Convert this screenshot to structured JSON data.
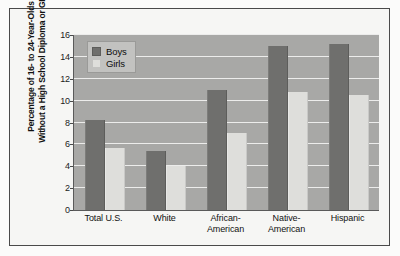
{
  "chart_data": {
    "type": "bar",
    "title": "",
    "xlabel": "",
    "ylabel": "Percentage of 16- to 24-Year-Olds Without a High School Diploma or GED",
    "ylabel_line1": "Percentage of 16- to 24-Year-Olds",
    "ylabel_line2": "Without a High School Diploma or GED",
    "categories": [
      "Total U.S.",
      "White",
      "African-American",
      "Native-American",
      "Hispanic"
    ],
    "category_lines": [
      [
        "Total U.S."
      ],
      [
        "White"
      ],
      [
        "African-",
        "American"
      ],
      [
        "Native-",
        "American"
      ],
      [
        "Hispanic"
      ]
    ],
    "series": [
      {
        "name": "Boys",
        "color": "#6f6f6d",
        "values": [
          8.2,
          5.4,
          11.0,
          15.0,
          15.2
        ]
      },
      {
        "name": "Girls",
        "color": "#dededb",
        "values": [
          5.7,
          4.0,
          7.0,
          10.8,
          10.5
        ]
      }
    ],
    "ylim": [
      0,
      16
    ],
    "ytick_values": [
      0,
      2,
      4,
      6,
      8,
      10,
      12,
      14,
      16
    ],
    "ytick_labels": [
      "0",
      "2",
      "4",
      "6",
      "8",
      "10",
      "12",
      "14",
      "16"
    ],
    "grid": true,
    "grid_orientation": "horizontal",
    "legend_position": "top-left",
    "legend_entries": [
      "Boys",
      "Girls"
    ],
    "plot_background": "#a8a8a6",
    "gridline_color": "#ececeb",
    "frame_color": "#4a4a4a"
  }
}
